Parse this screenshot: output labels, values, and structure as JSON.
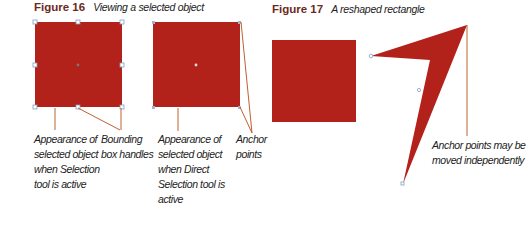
{
  "figure16": {
    "number": "Figure 16",
    "caption": "Viewing a selected object",
    "labels": {
      "selection_tool": [
        "Appearance of",
        "selected object",
        "when Selection",
        "tool is active"
      ],
      "bounding_box": [
        "Bounding",
        "box handles"
      ],
      "direct_selection": [
        "Appearance of",
        "selected object",
        "when Direct",
        "Selection tool is",
        "active"
      ],
      "anchor_points": [
        "Anchor",
        "points"
      ]
    }
  },
  "figure17": {
    "number": "Figure 17",
    "caption": "A reshaped rectangle",
    "labels": {
      "moved": [
        "Anchor points may be",
        "moved independently"
      ]
    }
  },
  "colors": {
    "fill": "#b3221a",
    "leader": "#c0602e",
    "handle": "#7f9ec0",
    "title": "#6b2a1e"
  }
}
